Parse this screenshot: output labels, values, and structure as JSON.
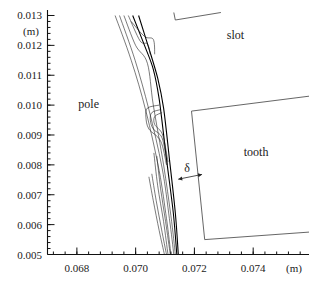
{
  "chart_data": {
    "type": "line",
    "title": "",
    "xlabel": "(m)",
    "ylabel": "(m)",
    "xlim": [
      0.067,
      0.0759
    ],
    "ylim": [
      0.005,
      0.0131
    ],
    "x_ticks": [
      {
        "value": 0.068,
        "label": "0.068"
      },
      {
        "value": 0.07,
        "label": "0.070"
      },
      {
        "value": 0.072,
        "label": "0.072"
      },
      {
        "value": 0.074,
        "label": "0.074"
      }
    ],
    "y_ticks": [
      {
        "value": 0.013,
        "label": "0.013"
      },
      {
        "value": 0.012,
        "label": "0.012"
      },
      {
        "value": 0.011,
        "label": "0.011"
      },
      {
        "value": 0.01,
        "label": "0.010"
      },
      {
        "value": 0.009,
        "label": "0.009"
      },
      {
        "value": 0.008,
        "label": "0.008"
      },
      {
        "value": 0.007,
        "label": "0.007"
      },
      {
        "value": 0.006,
        "label": "0.006"
      },
      {
        "value": 0.005,
        "label": "0.005"
      }
    ],
    "x_minor_step": 0.0004,
    "y_minor_step": 0.0002,
    "grid": false,
    "annotations": [
      {
        "text": "pole",
        "x": 0.0684,
        "y": 0.0099
      },
      {
        "text": "slot",
        "x": 0.0734,
        "y": 0.0122
      },
      {
        "text": "tooth",
        "x": 0.0741,
        "y": 0.0083
      },
      {
        "text": "δ",
        "x": 0.07175,
        "y": 0.00777
      }
    ],
    "gap_arrow": {
      "from": [
        0.07145,
        0.00752
      ],
      "to": [
        0.07226,
        0.00768
      ]
    },
    "boundaries": [
      {
        "name": "slot-upper-edge",
        "points": [
          [
            0.0713,
            0.0131
          ],
          [
            0.07135,
            0.01285
          ],
          [
            0.0729,
            0.0131
          ]
        ]
      },
      {
        "name": "tooth-outline",
        "points": [
          [
            0.0759,
            0.0103
          ],
          [
            0.0719,
            0.0098
          ],
          [
            0.07235,
            0.0055
          ],
          [
            0.0759,
            0.00575
          ]
        ]
      }
    ],
    "series": [
      {
        "name": "contour-1",
        "bold": false,
        "points": [
          [
            0.0693,
            0.013
          ],
          [
            0.06985,
            0.0115
          ],
          [
            0.07035,
            0.0098
          ],
          [
            0.0708,
            0.0078
          ],
          [
            0.07105,
            0.0062
          ],
          [
            0.0712,
            0.005
          ]
        ]
      },
      {
        "name": "contour-2",
        "bold": false,
        "points": [
          [
            0.06945,
            0.013
          ],
          [
            0.06998,
            0.0115
          ],
          [
            0.07045,
            0.00985
          ],
          [
            0.0709,
            0.0079
          ],
          [
            0.07115,
            0.0062
          ],
          [
            0.0713,
            0.005
          ]
        ]
      },
      {
        "name": "contour-3",
        "bold": false,
        "points": [
          [
            0.0696,
            0.013
          ],
          [
            0.07,
            0.012
          ],
          [
            0.0704,
            0.0114
          ],
          [
            0.0706,
            0.01
          ],
          [
            0.07095,
            0.008
          ],
          [
            0.0712,
            0.0063
          ],
          [
            0.07135,
            0.005
          ]
        ]
      },
      {
        "name": "contour-4",
        "bold": true,
        "points": [
          [
            0.0699,
            0.013
          ],
          [
            0.0703,
            0.012
          ],
          [
            0.0706,
            0.0112
          ],
          [
            0.0708,
            0.0102
          ],
          [
            0.07105,
            0.0082
          ],
          [
            0.07128,
            0.0064
          ],
          [
            0.0714,
            0.005
          ]
        ]
      },
      {
        "name": "contour-5",
        "bold": true,
        "points": [
          [
            0.0701,
            0.013
          ],
          [
            0.07045,
            0.0119
          ],
          [
            0.07075,
            0.0109
          ],
          [
            0.07095,
            0.0099
          ],
          [
            0.07115,
            0.0082
          ],
          [
            0.07135,
            0.0064
          ],
          [
            0.07145,
            0.005
          ]
        ]
      },
      {
        "name": "contour-6",
        "bold": false,
        "points": [
          [
            0.06975,
            0.013
          ],
          [
            0.07015,
            0.01215
          ],
          [
            0.0704,
            0.01205
          ],
          [
            0.0705,
            0.0117
          ]
        ]
      },
      {
        "name": "contour-7",
        "bold": false,
        "points": [
          [
            0.06985,
            0.0128
          ],
          [
            0.0703,
            0.0123
          ],
          [
            0.0706,
            0.0122
          ],
          [
            0.07065,
            0.0117
          ]
        ]
      },
      {
        "name": "contour-8",
        "bold": false,
        "points": [
          [
            0.0708,
            0.01
          ],
          [
            0.0704,
            0.0099
          ],
          [
            0.07035,
            0.0096
          ],
          [
            0.07045,
            0.0092
          ],
          [
            0.07085,
            0.0088
          ],
          [
            0.07105,
            0.008
          ]
        ]
      },
      {
        "name": "contour-9",
        "bold": false,
        "points": [
          [
            0.07085,
            0.00985
          ],
          [
            0.07055,
            0.00975
          ],
          [
            0.0705,
            0.0095
          ],
          [
            0.0706,
            0.0092
          ],
          [
            0.0709,
            0.0089
          ],
          [
            0.07108,
            0.008
          ]
        ]
      },
      {
        "name": "contour-10",
        "bold": false,
        "points": [
          [
            0.0709,
            0.00975
          ],
          [
            0.07065,
            0.00962
          ],
          [
            0.07065,
            0.00935
          ],
          [
            0.07092,
            0.009
          ],
          [
            0.0711,
            0.0081
          ]
        ]
      },
      {
        "name": "contour-11",
        "bold": false,
        "points": [
          [
            0.07062,
            0.0084
          ],
          [
            0.07075,
            0.0073
          ],
          [
            0.07095,
            0.0061
          ],
          [
            0.0711,
            0.005
          ]
        ]
      },
      {
        "name": "contour-12",
        "bold": false,
        "points": [
          [
            0.07072,
            0.0083
          ],
          [
            0.07085,
            0.0072
          ],
          [
            0.07102,
            0.0061
          ],
          [
            0.07118,
            0.005
          ]
        ]
      },
      {
        "name": "contour-13",
        "bold": false,
        "points": [
          [
            0.07045,
            0.0076
          ],
          [
            0.0706,
            0.0068
          ],
          [
            0.0708,
            0.0058
          ],
          [
            0.07098,
            0.005
          ]
        ]
      },
      {
        "name": "contour-14",
        "bold": false,
        "points": [
          [
            0.07055,
            0.0077
          ],
          [
            0.0707,
            0.0068
          ],
          [
            0.07088,
            0.00585
          ],
          [
            0.07105,
            0.005
          ]
        ]
      }
    ]
  }
}
